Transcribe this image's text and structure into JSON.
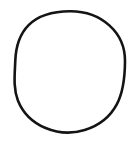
{
  "canvas": {
    "width": 137,
    "height": 143,
    "background_color": "#ffffff",
    "description": "Single black circle outline drawing on a plain white background"
  },
  "figure": {
    "name": "circle-outline",
    "shape_type": "circle",
    "stroke_color": "#141414",
    "fill_color": "none",
    "stroke_width": 2.6,
    "center_x": 70,
    "center_y": 71.5,
    "radius_x": 55,
    "radius_y": 60,
    "bounds": {
      "left": 15,
      "top": 11,
      "right": 125,
      "bottom": 132
    },
    "style_note": "hand-drawn / scanned appearance, slightly irregular outline",
    "path": "M 70.0 11.2 C 85.0 11.1 99.6 16.4 109.6 25.6 C 119.8 34.9 125.2 48.1 125.0 61.5 C 124.9 76.4 123.6 91.5 116.9 104.1 C 110.4 116.4 98.3 125.8 84.7 130.0 C 72.0 133.9 57.8 133.1 45.6 128.0 C 33.2 122.8 22.9 112.9 17.9 100.4 C 13.0 88.0 14.8 74.0 15.3 60.6 C 15.8 47.6 19.5 34.3 28.6 25.1 C 38.4 15.2 54.1 11.3 70.0 11.2 Z"
  },
  "elements": {
    "text_labels": [],
    "annotations": [],
    "legend": null,
    "axes": null
  }
}
